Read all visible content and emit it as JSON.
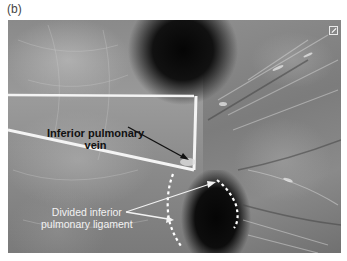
{
  "figure": {
    "panel_label": "(b)",
    "image_type": "grayscale thoracoscopic surgical photograph"
  },
  "annotations": [
    {
      "id": "vein",
      "text_line1": "Inferior pulmonary",
      "text_line2": "vein",
      "style": "bold black"
    },
    {
      "id": "ligament",
      "text_line1": "Divided inferior",
      "text_line2": "pulmonary ligament",
      "style": "white"
    }
  ],
  "icons": {
    "corner": "expand-icon"
  },
  "colors": {
    "tissue_mid": "#8a8a8a",
    "tissue_light": "#b5b5b5",
    "cavity": "#050505",
    "tape": "#f4f4f4",
    "vein_label": "#111111",
    "ligament_label": "#f2f2f2"
  }
}
